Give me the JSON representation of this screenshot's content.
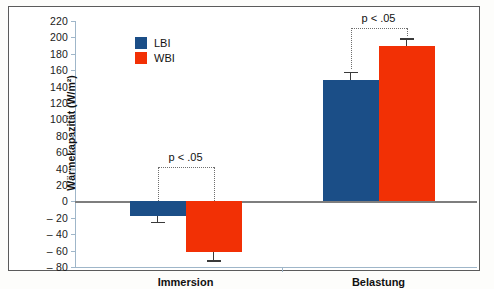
{
  "chart_data": {
    "type": "bar",
    "title": "",
    "xlabel": "",
    "ylabel": "Wärmekapazität (W/m²)",
    "categories": [
      "Immersion",
      "Belastung"
    ],
    "series": [
      {
        "name": "LBI",
        "color": "#1b4e87",
        "values": [
          -18,
          148
        ],
        "errors": [
          7,
          10
        ]
      },
      {
        "name": "WBI",
        "color": "#f23005",
        "values": [
          -62,
          190
        ],
        "errors": [
          10,
          9
        ]
      }
    ],
    "ylim": [
      -80,
      220
    ],
    "ytick_step": 20,
    "yticks": [
      220,
      200,
      180,
      160,
      140,
      120,
      100,
      80,
      60,
      40,
      20,
      0,
      "- 20",
      "- 40",
      "- 60",
      "- 80"
    ],
    "grid": false,
    "legend_position": "top-left-inside",
    "annotations": [
      {
        "text": "p < .05",
        "group": "Immersion"
      },
      {
        "text": "p < .05",
        "group": "Belastung"
      }
    ]
  },
  "legend": {
    "items": [
      {
        "label": "LBI",
        "color": "#1b4e87"
      },
      {
        "label": "WBI",
        "color": "#f23005"
      }
    ]
  },
  "axis": {
    "y_title": "Wärmekapazität (W/m²)",
    "x_categories": [
      "Immersion",
      "Belastung"
    ]
  },
  "significance": {
    "immersion_label": "p < .05",
    "belastung_label": "p < .05"
  }
}
